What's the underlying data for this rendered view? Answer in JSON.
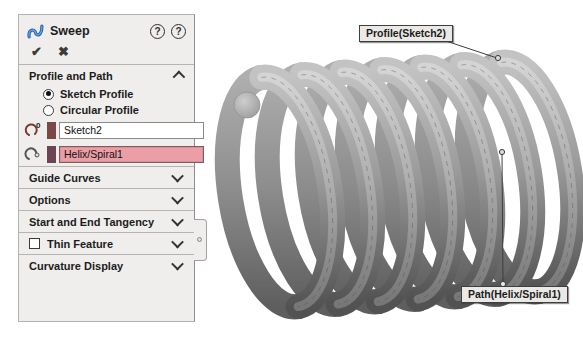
{
  "panel": {
    "title": "Sweep",
    "actions": {
      "ok": "✔",
      "cancel": "✖",
      "help_pin": "?",
      "help": "?"
    },
    "sections": [
      {
        "label": "Profile and Path",
        "state": "expanded"
      },
      {
        "label": "Guide Curves",
        "state": "collapsed"
      },
      {
        "label": "Options",
        "state": "collapsed"
      },
      {
        "label": "Start and End Tangency",
        "state": "collapsed"
      },
      {
        "label": "Thin Feature",
        "state": "collapsed",
        "has_checkbox": true,
        "checked": false
      },
      {
        "label": "Curvature Display",
        "state": "collapsed"
      }
    ],
    "profile_and_path": {
      "radios": [
        {
          "label": "Sketch Profile",
          "selected": true
        },
        {
          "label": "Circular Profile",
          "selected": false
        }
      ],
      "profile_field": {
        "value": "Sketch2",
        "active": false
      },
      "path_field": {
        "value": "Helix/Spiral1",
        "active": true
      }
    }
  },
  "viewport": {
    "model": "helical-coil-spring",
    "callouts": [
      {
        "label": "Profile(Sketch2)"
      },
      {
        "label": "Path(Helix/Spiral1)"
      }
    ]
  },
  "colors": {
    "panel_bg": "#efeeec",
    "active_field_bg": "#ec9ea6",
    "profile_bar": "#7a4848",
    "path_bar": "#6d4455",
    "callout_bg": "#eae9e5",
    "sweep_icon_blue": "#1e62b8"
  }
}
